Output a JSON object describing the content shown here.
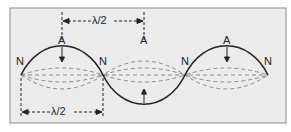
{
  "diagram": {
    "node_label": "N",
    "antinode_label": "A",
    "half_wavelength_label": "λ/2",
    "background_color": "#ececec",
    "border_color": "#888888",
    "solid_wave_color": "#222222",
    "dashed_wave_color": "#8a8a8a",
    "nodes": [
      {
        "label": "N"
      },
      {
        "label": "N"
      },
      {
        "label": "N"
      },
      {
        "label": "N"
      }
    ],
    "antinodes": [
      {
        "label": "A"
      },
      {
        "label": "A"
      },
      {
        "label": "A"
      }
    ],
    "dimensions": [
      {
        "label": "λ/2",
        "position": "top"
      },
      {
        "label": "λ/2",
        "position": "bottom"
      }
    ]
  }
}
